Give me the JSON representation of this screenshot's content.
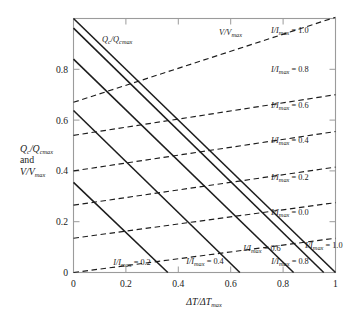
{
  "chart_data": {
    "type": "line",
    "title": "",
    "xlabel": "ΔT/ΔT_max",
    "ylabel": "Q_c/Q_cmax and V/V_max",
    "xlim": [
      0,
      1
    ],
    "ylim": [
      0,
      1.0
    ],
    "grid": false,
    "legend_position": "inline-annotations",
    "x_ticks": [
      "0",
      "0.2",
      "0.4",
      "0.6",
      "0.8",
      "1"
    ],
    "x_tick_values": [
      0,
      0.2,
      0.4,
      0.6,
      0.8,
      1
    ],
    "y_ticks": [
      "0",
      "0.2",
      "0.4",
      "0.6",
      "0.8"
    ],
    "y_tick_values": [
      0,
      0.2,
      0.4,
      0.6,
      0.8
    ],
    "series": [
      {
        "name": "Qc/Qcmax, I/Imax = 0.2",
        "style": "solid",
        "x": [
          0,
          0.36
        ],
        "values": [
          0.355,
          0.0
        ]
      },
      {
        "name": "Qc/Qcmax, I/Imax = 0.4",
        "style": "solid",
        "x": [
          0,
          0.635
        ],
        "values": [
          0.638,
          0.0
        ]
      },
      {
        "name": "Qc/Qcmax, I/Imax = 0.6",
        "style": "solid",
        "x": [
          0,
          0.84
        ],
        "values": [
          0.84,
          0.0
        ]
      },
      {
        "name": "Qc/Qcmax, I/Imax = 0.8",
        "style": "solid",
        "x": [
          0,
          0.955
        ],
        "values": [
          0.962,
          0.0
        ]
      },
      {
        "name": "Qc/Qcmax, I/Imax = 1.0",
        "style": "solid",
        "x": [
          0,
          1.0
        ],
        "values": [
          1.0,
          0.0
        ]
      },
      {
        "name": "V/Vmax, I/Imax = 0.0",
        "style": "dashed",
        "x": [
          0,
          1.0
        ],
        "values": [
          0.0,
          0.135
        ]
      },
      {
        "name": "V/Vmax, I/Imax = 0.2",
        "style": "dashed",
        "x": [
          0,
          1.0
        ],
        "values": [
          0.135,
          0.275
        ]
      },
      {
        "name": "V/Vmax, I/Imax = 0.4",
        "style": "dashed",
        "x": [
          0,
          1.0
        ],
        "values": [
          0.265,
          0.415
        ]
      },
      {
        "name": "V/Vmax, I/Imax = 0.6",
        "style": "dashed",
        "x": [
          0,
          1.0
        ],
        "values": [
          0.4,
          0.555
        ]
      },
      {
        "name": "V/Vmax, I/Imax = 0.8",
        "style": "dashed",
        "x": [
          0,
          1.0
        ],
        "values": [
          0.54,
          0.7
        ]
      },
      {
        "name": "V/Vmax, I/Imax = 1.0",
        "style": "dashed",
        "x": [
          0,
          1.0
        ],
        "values": [
          0.67,
          1.005
        ]
      }
    ],
    "annotations": [
      {
        "id": "qc-family-label",
        "text": "Qc/Qcmax",
        "x": 0.3,
        "y": 0.93
      },
      {
        "id": "v-family-label",
        "text": "V/Vmax",
        "x": 0.62,
        "y": 1.0
      },
      {
        "id": "right-1.0",
        "text": "I/Imax = 1.0",
        "x": 0.93,
        "y": 1.0
      },
      {
        "id": "right-0.8",
        "text": "I/Imax = 0.8",
        "x": 0.93,
        "y": 0.845
      },
      {
        "id": "right-0.6",
        "text": "I/Imax = 0.6",
        "x": 0.93,
        "y": 0.7
      },
      {
        "id": "right-0.4",
        "text": "I/Imax = 0.4",
        "x": 0.93,
        "y": 0.565
      },
      {
        "id": "right-0.2",
        "text": "I/Imax = 0.2",
        "x": 0.93,
        "y": 0.415
      },
      {
        "id": "right-0.0",
        "text": "I/Imax = 0.0",
        "x": 0.93,
        "y": 0.275
      },
      {
        "id": "bottom-0.2",
        "text": "I/Imax = 0.2",
        "x": 0.28,
        "y": 0.035
      },
      {
        "id": "bottom-0.4",
        "text": "I/Imax = 0.4",
        "x": 0.52,
        "y": 0.045
      },
      {
        "id": "bottom-0.6",
        "text": "I/Imax = 0.6",
        "x": 0.72,
        "y": 0.075
      },
      {
        "id": "bottom-0.8",
        "text": "I/Imax = 0.8",
        "x": 0.83,
        "y": 0.035
      },
      {
        "id": "bottom-1.0",
        "text": "I/Imax = 1.0",
        "x": 0.9,
        "y": 0.085
      }
    ]
  },
  "labels": {
    "x_axis_title_main": "ΔT/ΔT",
    "x_axis_title_sub": "max",
    "y_axis_line1_main": "Q",
    "y_axis_line1_sub1": "c",
    "y_axis_line1_mid": "/Q",
    "y_axis_line1_sub2": "cmax",
    "y_axis_line2": "and",
    "y_axis_line3_main": "V/V",
    "y_axis_line3_sub": "max",
    "qc_family_main": "Q",
    "qc_family_sub1": "c",
    "qc_family_mid": "/Q",
    "qc_family_sub2": "cmax",
    "v_family_main": "V/V",
    "v_family_sub": "max",
    "ratio_main": "I/I",
    "ratio_sub": "max",
    "equals": " = ",
    "val_1_0": "1.0",
    "val_0_8": "0.8",
    "val_0_6": "0.6",
    "val_0_4": "0.4",
    "val_0_2": "0.2",
    "val_0_0": "0.0",
    "tick_0": "0",
    "tick_02": "0.2",
    "tick_04": "0.4",
    "tick_06": "0.6",
    "tick_08": "0.8",
    "tick_1": "1"
  }
}
